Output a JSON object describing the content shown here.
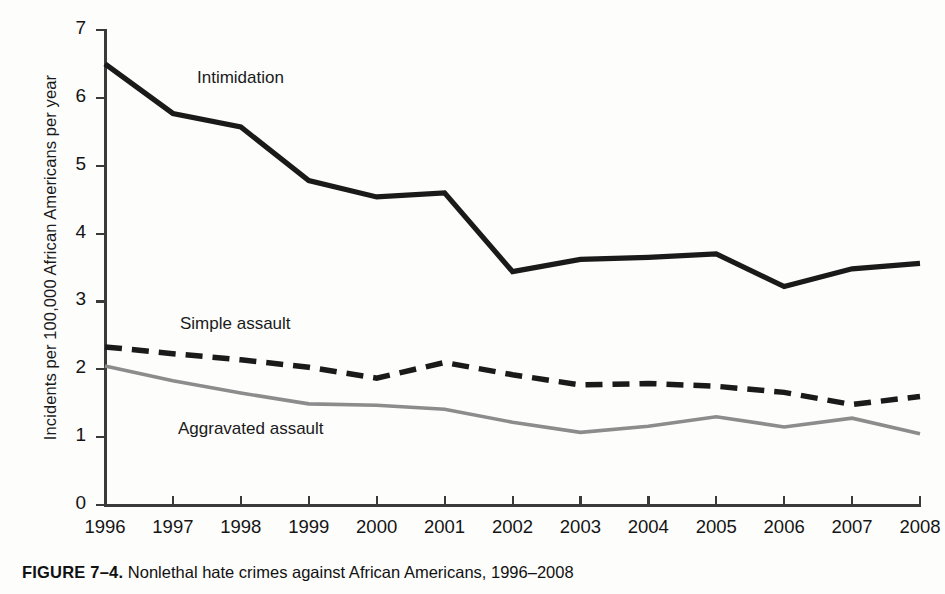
{
  "figure": {
    "caption_prefix": "FIGURE 7–4.",
    "caption_text": "Nonlethal hate crimes against African Americans, 1996–2008"
  },
  "axes": {
    "y_title": "Incidents per 100,000 African Americans per year",
    "y_ticks": [
      "0",
      "1",
      "2",
      "3",
      "4",
      "5",
      "6",
      "7"
    ],
    "x_ticks": [
      "1996",
      "1997",
      "1998",
      "1999",
      "2000",
      "2001",
      "2002",
      "2003",
      "2004",
      "2005",
      "2006",
      "2007",
      "2008"
    ]
  },
  "series_labels": {
    "intimidation": "Intimidation",
    "simple_assault": "Simple assault",
    "aggravated_assault": "Aggravated assault"
  },
  "colors": {
    "intimidation": "#1a1a1a",
    "simple_assault": "#1a1a1a",
    "aggravated_assault": "#8c8c8c",
    "axis": "#3a3a3a",
    "background": "#fdfdfc"
  },
  "chart_data": {
    "type": "line",
    "title": "Nonlethal hate crimes against African Americans, 1996–2008",
    "xlabel": "",
    "ylabel": "Incidents per 100,000 African Americans per year",
    "x": [
      1996,
      1997,
      1998,
      1999,
      2000,
      2001,
      2002,
      2003,
      2004,
      2005,
      2006,
      2007,
      2008
    ],
    "xlim": [
      1996,
      2008
    ],
    "ylim": [
      0,
      7
    ],
    "yticks": [
      0,
      1,
      2,
      3,
      4,
      5,
      6,
      7
    ],
    "grid": false,
    "legend": "inline-labels",
    "series": [
      {
        "name": "Intimidation",
        "style": "solid",
        "color": "#1a1a1a",
        "values": [
          6.5,
          5.77,
          5.57,
          4.78,
          4.54,
          4.6,
          3.44,
          3.62,
          3.65,
          3.7,
          3.22,
          3.48,
          3.56
        ]
      },
      {
        "name": "Simple assault",
        "style": "dashed",
        "color": "#1a1a1a",
        "values": [
          2.33,
          2.23,
          2.14,
          2.03,
          1.87,
          2.1,
          1.92,
          1.77,
          1.79,
          1.75,
          1.66,
          1.48,
          1.6
        ]
      },
      {
        "name": "Aggravated assault",
        "style": "solid",
        "color": "#8c8c8c",
        "values": [
          2.05,
          1.83,
          1.65,
          1.49,
          1.47,
          1.41,
          1.22,
          1.07,
          1.16,
          1.3,
          1.15,
          1.28,
          1.05
        ]
      }
    ]
  }
}
